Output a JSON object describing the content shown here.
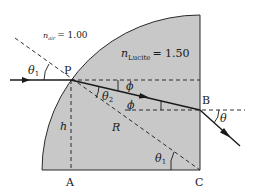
{
  "diagram": {
    "media": {
      "air": {
        "symbol": "n",
        "subscript": "air",
        "equals": "= 1.00"
      },
      "lucite": {
        "symbol": "n",
        "subscript": "Lucite",
        "equals": "= 1.50"
      }
    },
    "points": {
      "P": "P",
      "B": "B",
      "A": "A",
      "C": "C"
    },
    "angles": {
      "theta1_incident": {
        "symbol": "θ",
        "subscript": "1"
      },
      "theta2": {
        "symbol": "θ",
        "subscript": "2"
      },
      "phi_upper": "ϕ",
      "phi_lower": "ϕ",
      "theta_exit": "θ",
      "theta1_at_C": {
        "symbol": "θ",
        "subscript": "1"
      }
    },
    "lengths": {
      "h": "h",
      "R": "R"
    },
    "colors": {
      "lucite_fill": "#c8c8c8",
      "ink": "#1a1a1a",
      "background": "#ffffff"
    }
  }
}
